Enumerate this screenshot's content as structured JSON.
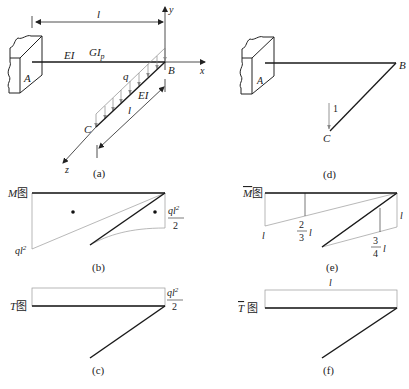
{
  "panels": {
    "a": {
      "caption": "(a)",
      "point_A": "A",
      "point_B": "B",
      "point_C": "C",
      "span_label_top": "l",
      "span_label_BC": "l",
      "stiffness_AB": "EI",
      "torsion_AB": "GI",
      "torsion_sub": "p",
      "stiffness_BC": "EI",
      "load": "q",
      "axis_x": "x",
      "axis_y": "y",
      "axis_z": "z"
    },
    "d": {
      "caption": "(d)",
      "point_A": "A",
      "point_B": "B",
      "point_C": "C",
      "unit_load": "1"
    },
    "b": {
      "caption": "(b)",
      "title_M": "M",
      "title_suffix": "图",
      "value_left": "ql",
      "value_left_exp": "2",
      "value_right_num": "ql",
      "value_right_exp": "2",
      "value_right_den": "2"
    },
    "e": {
      "caption": "(e)",
      "title_M": "M",
      "title_suffix": "图",
      "value_left": "l",
      "value_mid_num": "2",
      "value_mid_den": "3",
      "value_mid_var": "l",
      "value_right": "l",
      "value_br_num": "3",
      "value_br_den": "4",
      "value_br_var": "l"
    },
    "c": {
      "caption": "(c)",
      "title_T": "T",
      "title_suffix": "图",
      "value_num": "ql",
      "value_exp": "2",
      "value_den": "2"
    },
    "f": {
      "caption": "(f)",
      "title_T": "T",
      "title_suffix": " 图",
      "value_top": "l"
    }
  },
  "colors": {
    "line": "#1a1a1a",
    "thin": "#777777",
    "load": "#888888"
  }
}
